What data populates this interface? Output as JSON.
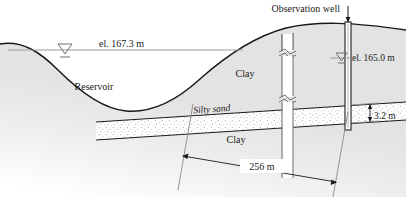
{
  "figure": {
    "type": "geotechnical-cross-section",
    "title_visible": false
  },
  "labels": {
    "observation_well": "Observation well",
    "reservoir": "Reservoir",
    "water_elevation_left": "el. 167.3 m",
    "water_elevation_right": "el. 165.0 m",
    "clay_upper": "Clay",
    "clay_lower": "Clay",
    "silty_sand": "Silty sand"
  },
  "dimensions": {
    "horizontal_distance": "256 m",
    "layer_thickness": "3.2 m"
  },
  "icons": {
    "water_table_left": "water-table-triangle-icon",
    "water_table_right": "water-table-triangle-icon",
    "pointer": "arrow-down-icon"
  },
  "colors": {
    "ground_fill": "#e3e3e3",
    "soil_line": "#1a1a1a",
    "water_line": "#9a9a9a",
    "sand_fill": "#ffffff",
    "well_casing": "#ffffff",
    "well_pipe_stroke": "#4a4a4a",
    "text": "#1a1a1a"
  }
}
